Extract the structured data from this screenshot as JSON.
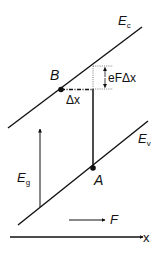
{
  "diagram": {
    "type": "band-diagram",
    "labels": {
      "conduction_band": "E",
      "conduction_band_sub": "c",
      "valence_band": "E",
      "valence_band_sub": "v",
      "band_gap": "E",
      "band_gap_sub": "g",
      "point_b": "B",
      "point_a": "A",
      "delta_x": "Δx",
      "energy_drop": "eFΔx",
      "field": "F",
      "x_axis": "x"
    },
    "colors": {
      "line": "#111111",
      "background": "#ffffff"
    }
  }
}
